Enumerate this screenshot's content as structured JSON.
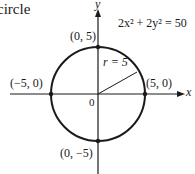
{
  "title_fragment": "circle",
  "equation": "2x² + 2y² = 50",
  "axes": {
    "x_label": "x",
    "y_label": "y",
    "origin_label": "0"
  },
  "radius_label": "r = 5",
  "points": [
    {
      "label": "(0, 5)"
    },
    {
      "label": "(−5, 0)"
    },
    {
      "label": "(5, 0)"
    },
    {
      "label": "(0, −5)"
    }
  ],
  "colors": {
    "ink": "#1a1a1a",
    "background": "#ffffff"
  }
}
